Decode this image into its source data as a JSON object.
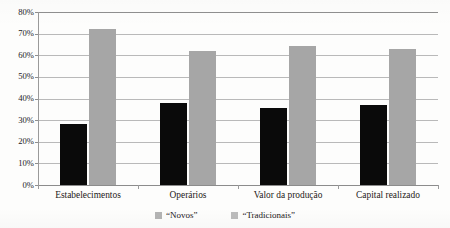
{
  "chart_data": {
    "type": "bar",
    "title": "",
    "xlabel": "",
    "ylabel": "",
    "categories": [
      "Estabelecimentos",
      "Operários",
      "Valor da produção",
      "Capital realizado"
    ],
    "series": [
      {
        "name": "“Novos”",
        "values": [
          28,
          38,
          35.5,
          37
        ],
        "color": "#0a0a0a"
      },
      {
        "name": "“Tradicionais”",
        "values": [
          72,
          62,
          64.5,
          63
        ],
        "color": "#a6a6a6"
      }
    ],
    "ylim": [
      0,
      80
    ],
    "ytick_labels": [
      "80%",
      "70%",
      "60%",
      "50%",
      "40%",
      "30%",
      "20%",
      "10%",
      "0%"
    ],
    "ytick_values": [
      80,
      70,
      60,
      50,
      40,
      30,
      20,
      10,
      0
    ],
    "grid": true,
    "legend_position": "bottom-center",
    "value_suffix": "%"
  },
  "legend": {
    "items": [
      {
        "label": "“Novos”"
      },
      {
        "label": "“Tradicionais”"
      }
    ]
  }
}
